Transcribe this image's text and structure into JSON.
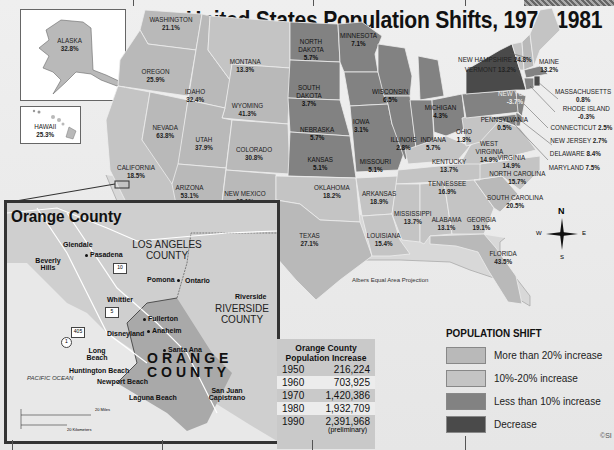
{
  "title": "United States Population Shifts, 1970-1981",
  "projection": "Albers Equal Area Projection",
  "copyright": "©SI",
  "colors": {
    "more_than_20": "#b9b9b9",
    "between_10_20": "#c4c4c4",
    "less_than_10": "#828282",
    "decrease": "#4a4a4a",
    "background": "#e9e9e9"
  },
  "states": {
    "alaska": {
      "name": "ALASKA",
      "value": "32.8%",
      "category": "more_than_20"
    },
    "hawaii": {
      "name": "HAWAII",
      "value": "25.3%",
      "category": "more_than_20"
    },
    "washington": {
      "name": "WASHINGTON",
      "value": "21.1%",
      "category": "more_than_20"
    },
    "oregon": {
      "name": "OREGON",
      "value": "25.9%",
      "category": "more_than_20"
    },
    "california": {
      "name": "CALIFORNIA",
      "value": "18.5%",
      "category": "between_10_20"
    },
    "idaho": {
      "name": "IDAHO",
      "value": "32.4%",
      "category": "more_than_20"
    },
    "nevada": {
      "name": "NEVADA",
      "value": "63.8%",
      "category": "more_than_20"
    },
    "montana": {
      "name": "MONTANA",
      "value": "13.3%",
      "category": "between_10_20"
    },
    "wyoming": {
      "name": "WYOMING",
      "value": "41.3%",
      "category": "more_than_20"
    },
    "utah": {
      "name": "UTAH",
      "value": "37.9%",
      "category": "more_than_20"
    },
    "colorado": {
      "name": "COLORADO",
      "value": "30.8%",
      "category": "more_than_20"
    },
    "arizona": {
      "name": "ARIZONA",
      "value": "53.1%",
      "category": "more_than_20"
    },
    "new_mexico": {
      "name": "NEW MEXICO",
      "value": "28.1%",
      "category": "more_than_20"
    },
    "north_dakota": {
      "name": "NORTH DAKOTA",
      "value": "5.7%",
      "category": "less_than_10"
    },
    "south_dakota": {
      "name": "SOUTH DAKOTA",
      "value": "3.7%",
      "category": "less_than_10"
    },
    "nebraska": {
      "name": "NEBRASKA",
      "value": "5.7%",
      "category": "less_than_10"
    },
    "kansas": {
      "name": "KANSAS",
      "value": "5.1%",
      "category": "less_than_10"
    },
    "oklahoma": {
      "name": "OKLAHOMA",
      "value": "18.2%",
      "category": "between_10_20"
    },
    "texas": {
      "name": "TEXAS",
      "value": "27.1%",
      "category": "more_than_20"
    },
    "minnesota": {
      "name": "MINNESOTA",
      "value": "7.1%",
      "category": "less_than_10"
    },
    "iowa": {
      "name": "IOWA",
      "value": "3.1%",
      "category": "less_than_10"
    },
    "missouri": {
      "name": "MISSOURI",
      "value": "5.1%",
      "category": "less_than_10"
    },
    "arkansas": {
      "name": "ARKANSAS",
      "value": "18.9%",
      "category": "between_10_20"
    },
    "louisiana": {
      "name": "LOUISIANA",
      "value": "15.4%",
      "category": "between_10_20"
    },
    "wisconsin": {
      "name": "WISCONSIN",
      "value": "6.5%",
      "category": "less_than_10"
    },
    "illinois": {
      "name": "ILLINOIS",
      "value": "2.8%",
      "category": "less_than_10"
    },
    "michigan": {
      "name": "MICHIGAN",
      "value": "4.3%",
      "category": "less_than_10"
    },
    "indiana": {
      "name": "INDIANA",
      "value": "5.7%",
      "category": "less_than_10"
    },
    "ohio": {
      "name": "OHIO",
      "value": "1.3%",
      "category": "less_than_10"
    },
    "kentucky": {
      "name": "KENTUCKY",
      "value": "13.7%",
      "category": "between_10_20"
    },
    "tennessee": {
      "name": "TENNESSEE",
      "value": "16.9%",
      "category": "between_10_20"
    },
    "mississippi": {
      "name": "MISSISSIPPI",
      "value": "13.7%",
      "category": "between_10_20"
    },
    "alabama": {
      "name": "ALABAMA",
      "value": "13.1%",
      "category": "between_10_20"
    },
    "georgia": {
      "name": "GEORGIA",
      "value": "19.1%",
      "category": "between_10_20"
    },
    "florida": {
      "name": "FLORIDA",
      "value": "43.5%",
      "category": "more_than_20"
    },
    "south_carolina": {
      "name": "SOUTH CAROLINA",
      "value": "20.5%",
      "category": "more_than_20"
    },
    "north_carolina": {
      "name": "NORTH CAROLINA",
      "value": "15.7%",
      "category": "between_10_20"
    },
    "virginia": {
      "name": "VIRGINIA",
      "value": "14.9%",
      "category": "between_10_20"
    },
    "west_virginia": {
      "name": "WEST VIRGINIA",
      "value": "14.9%",
      "category": "between_10_20"
    },
    "pennsylvania": {
      "name": "PENNSYLVANIA",
      "value": "0.5%",
      "category": "less_than_10"
    },
    "new_york": {
      "name": "NEW YORK",
      "value": "-3.7%",
      "category": "decrease"
    },
    "maine": {
      "name": "MAINE",
      "value": "13.2%",
      "category": "between_10_20"
    },
    "new_hampshire": {
      "name": "NEW HAMPSHIRE",
      "value": "24.8%",
      "category": "more_than_20"
    },
    "vermont": {
      "name": "VERMONT",
      "value": "13.2%",
      "category": "between_10_20"
    },
    "massachusetts": {
      "name": "MASSACHUSETTS",
      "value": "0.8%",
      "category": "less_than_10"
    },
    "rhode_island": {
      "name": "RHODE ISLAND",
      "value": "-0.3%",
      "category": "decrease"
    },
    "connecticut": {
      "name": "CONNECTICUT",
      "value": "2.5%",
      "category": "less_than_10"
    },
    "new_jersey": {
      "name": "NEW JERSEY",
      "value": "2.7%",
      "category": "less_than_10"
    },
    "delaware": {
      "name": "DELAWARE",
      "value": "8.4%",
      "category": "less_than_10"
    },
    "maryland": {
      "name": "MARYLAND",
      "value": "7.5%",
      "category": "less_than_10"
    }
  },
  "compass": {
    "n": "N",
    "s": "S",
    "e": "E",
    "w": "W"
  },
  "orange_county_map": {
    "title": "Orange County",
    "la_county": "LOS ANGELES COUNTY",
    "riverside_county": "RIVERSIDE COUNTY",
    "orange_county": "ORANGE COUNTY",
    "ocean": "PACIFIC OCEAN",
    "cities": [
      "Glendale",
      "Pasadena",
      "Beverly Hills",
      "Pomona",
      "Ontario",
      "Whittier",
      "Riverside",
      "Fullerton",
      "Anaheim",
      "Disneyland",
      "Santa Ana",
      "Long Beach",
      "Huntington Beach",
      "Newport Beach",
      "Laguna Beach",
      "San Juan Capistrano"
    ],
    "highways": [
      "10",
      "5",
      "405",
      "1"
    ],
    "scale": {
      "miles": "20 Miles",
      "km": "20 Kilometers",
      "zero": "0"
    }
  },
  "population_table": {
    "title_line1": "Orange County",
    "title_line2": "Population Increase",
    "rows": [
      {
        "year": "1950",
        "value": "216,224"
      },
      {
        "year": "1960",
        "value": "703,925"
      },
      {
        "year": "1970",
        "value": "1,420,386"
      },
      {
        "year": "1980",
        "value": "1,932,709"
      },
      {
        "year": "1990",
        "value": "2,391,968"
      }
    ],
    "note": "(preliminary)"
  },
  "legend": {
    "title": "POPULATION SHIFT",
    "items": [
      {
        "label": "More than 20% increase",
        "color": "#b9b9b9"
      },
      {
        "label": "10%-20% increase",
        "color": "#c4c4c4"
      },
      {
        "label": "Less than 10% increase",
        "color": "#828282"
      },
      {
        "label": "Decrease",
        "color": "#4a4a4a"
      }
    ]
  }
}
